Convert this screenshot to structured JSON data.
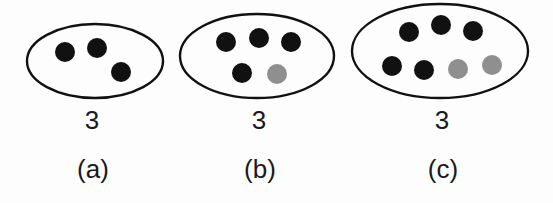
{
  "figure": {
    "colors": {
      "background": "#fdfdfd",
      "ellipse_stroke": "#111111",
      "dot_black": "#111111",
      "dot_gray": "#8f8f8f",
      "text": "#1a1a1a"
    },
    "dot_radius": 10,
    "ellipse_stroke_width": 2.4,
    "sets": [
      {
        "id": "a",
        "caption": "(a)",
        "count_label": "3",
        "black_dot_count": 3,
        "gray_dot_count": 0,
        "ellipse": {
          "cx": 95,
          "cy": 61,
          "rx": 68,
          "ry": 37
        },
        "dots": [
          {
            "x": 65,
            "y": 52,
            "color": "black"
          },
          {
            "x": 97,
            "y": 48,
            "color": "black"
          },
          {
            "x": 121,
            "y": 72,
            "color": "black"
          }
        ]
      },
      {
        "id": "b",
        "caption": "(b)",
        "count_label": "3",
        "black_dot_count": 4,
        "gray_dot_count": 1,
        "ellipse": {
          "cx": 257,
          "cy": 56,
          "rx": 77,
          "ry": 42
        },
        "dots": [
          {
            "x": 226,
            "y": 42,
            "color": "black"
          },
          {
            "x": 259,
            "y": 38,
            "color": "black"
          },
          {
            "x": 291,
            "y": 42,
            "color": "black"
          },
          {
            "x": 242,
            "y": 73,
            "color": "black"
          },
          {
            "x": 277,
            "y": 74,
            "color": "gray"
          }
        ]
      },
      {
        "id": "c",
        "caption": "(c)",
        "count_label": "3",
        "black_dot_count": 5,
        "gray_dot_count": 2,
        "ellipse": {
          "cx": 440,
          "cy": 51,
          "rx": 88,
          "ry": 47
        },
        "dots": [
          {
            "x": 409,
            "y": 32,
            "color": "black"
          },
          {
            "x": 441,
            "y": 25,
            "color": "black"
          },
          {
            "x": 473,
            "y": 31,
            "color": "black"
          },
          {
            "x": 392,
            "y": 66,
            "color": "black"
          },
          {
            "x": 424,
            "y": 70,
            "color": "black"
          },
          {
            "x": 458,
            "y": 69,
            "color": "gray"
          },
          {
            "x": 492,
            "y": 65,
            "color": "gray"
          }
        ]
      }
    ]
  }
}
